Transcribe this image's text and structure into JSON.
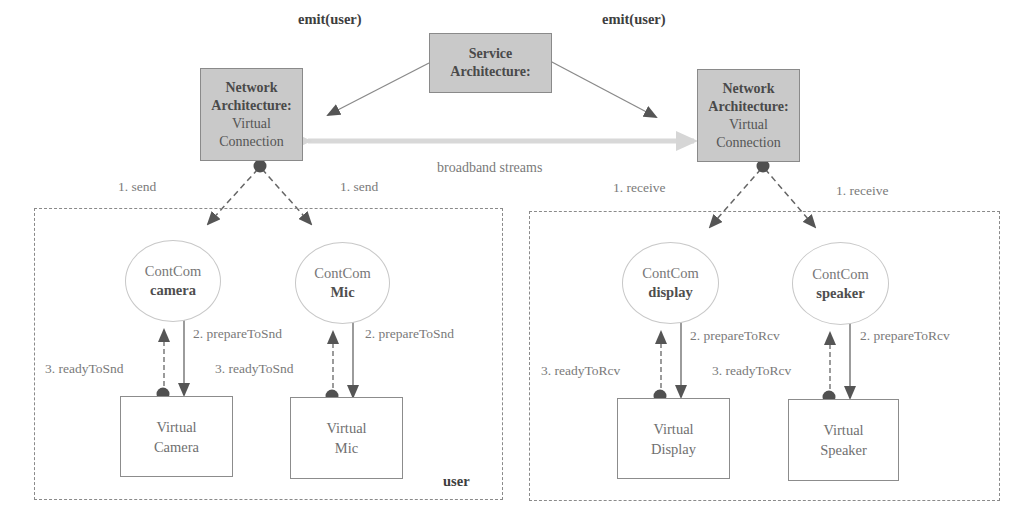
{
  "service": {
    "line1": "Service",
    "line2": "Architecture:"
  },
  "network_left": {
    "line1": "Network",
    "line2": "Architecture:",
    "line3": "Virtual",
    "line4": "Connection"
  },
  "network_right": {
    "line1": "Network",
    "line2": "Architecture:",
    "line3": "Virtual",
    "line4": "Connection"
  },
  "edges": {
    "emit_left": "emit(user)",
    "emit_right": "emit(user)",
    "broadband": "broadband streams",
    "send_left": "1. send",
    "send_right": "1. send",
    "receive_left": "1. receive",
    "receive_right": "1. receive"
  },
  "sender_region": {
    "label": "user",
    "components": [
      {
        "title": "ContCom",
        "name": "camera",
        "device_line1": "Virtual",
        "device_line2": "Camera",
        "prepare": "2. prepareToSnd",
        "ready": "3. readyToSnd"
      },
      {
        "title": "ContCom",
        "name": "Mic",
        "device_line1": "Virtual",
        "device_line2": "Mic",
        "prepare": "2. prepareToSnd",
        "ready": "3. readyToSnd"
      }
    ]
  },
  "receiver_region": {
    "components": [
      {
        "title": "ContCom",
        "name": "display",
        "device_line1": "Virtual",
        "device_line2": "Display",
        "prepare": "2. prepareToRcv",
        "ready": "3. readyToRcv"
      },
      {
        "title": "ContCom",
        "name": "speaker",
        "device_line1": "Virtual",
        "device_line2": "Speaker",
        "prepare": "2. prepareToRcv",
        "ready": "3. readyToRcv"
      }
    ]
  },
  "colors": {
    "node_fill": "#c9c9c9",
    "arrow": "#5a5a5a",
    "stream": "#d8d8d8"
  }
}
